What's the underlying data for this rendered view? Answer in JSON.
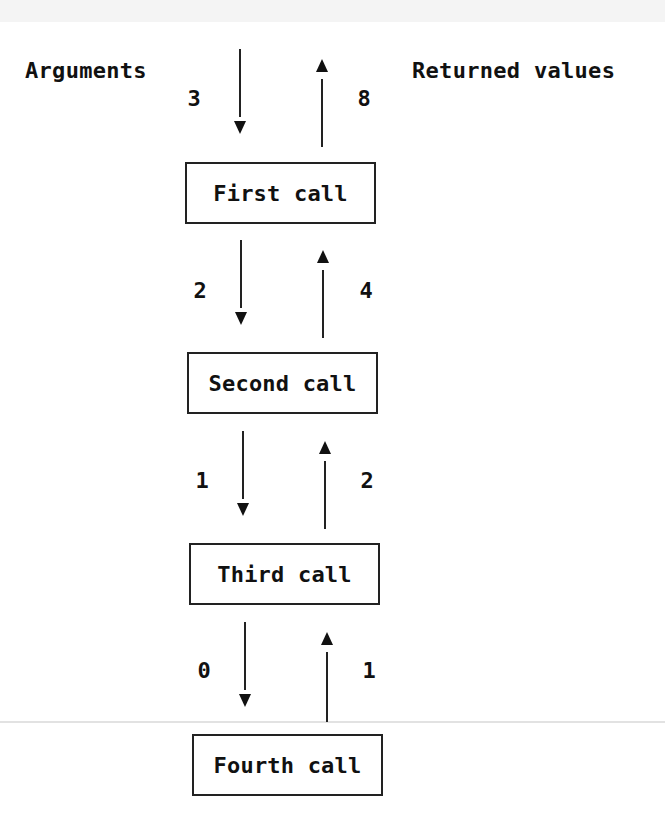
{
  "headers": {
    "left": "Arguments",
    "right": "Returned values"
  },
  "calls": [
    {
      "label": "First call",
      "argument_in": "3",
      "return_out": "8"
    },
    {
      "label": "Second call",
      "argument_in": "2",
      "return_out": "4"
    },
    {
      "label": "Third call",
      "argument_in": "1",
      "return_out": "2"
    },
    {
      "label": "Fourth call",
      "argument_in": "0",
      "return_out": "1"
    }
  ]
}
